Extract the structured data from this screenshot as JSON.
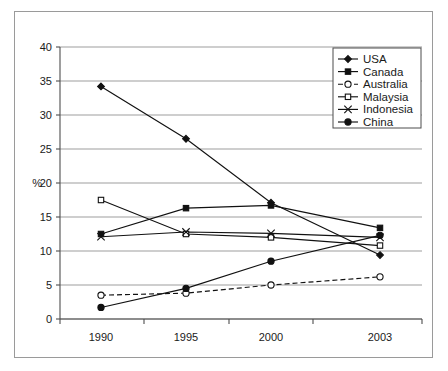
{
  "figure": {
    "background_color": "#ffffff",
    "frame_color": "#9a9a9a",
    "ink_color": "#111111",
    "grid_color": "#9d9d9d"
  },
  "axis": {
    "y_title": "%",
    "y_ticks": [
      "0",
      "5",
      "10",
      "15",
      "20",
      "25",
      "30",
      "35",
      "40"
    ],
    "x_ticks": [
      "1990",
      "1995",
      "2000",
      "2003"
    ]
  },
  "legend": {
    "position": "top-right",
    "entries": [
      {
        "label": "USA",
        "marker": "filled-diamond",
        "line": "solid"
      },
      {
        "label": "Canada",
        "marker": "filled-square",
        "line": "solid"
      },
      {
        "label": "Australia",
        "marker": "open-circle",
        "line": "dashed"
      },
      {
        "label": "Malaysia",
        "marker": "open-square",
        "line": "solid"
      },
      {
        "label": "Indonesia",
        "marker": "cross-x",
        "line": "solid"
      },
      {
        "label": "China",
        "marker": "filled-circle",
        "line": "solid"
      }
    ]
  },
  "chart_data": {
    "type": "line",
    "title": "",
    "subtitle": "",
    "xlabel": "",
    "ylabel": "%",
    "categories": [
      "1990",
      "1995",
      "2000",
      "2003"
    ],
    "ylim": [
      0,
      40
    ],
    "ytick_step": 5,
    "grid": true,
    "legend_position": "top-right",
    "series": [
      {
        "name": "USA",
        "values": [
          34.2,
          26.5,
          17.1,
          9.4
        ],
        "marker": "filled-diamond",
        "line": "solid"
      },
      {
        "name": "Canada",
        "values": [
          12.5,
          16.3,
          16.7,
          13.4
        ],
        "marker": "filled-square",
        "line": "solid"
      },
      {
        "name": "Australia",
        "values": [
          3.5,
          3.8,
          5.0,
          6.2
        ],
        "marker": "open-circle",
        "line": "dashed"
      },
      {
        "name": "Malaysia",
        "values": [
          17.5,
          12.5,
          12.0,
          10.8
        ],
        "marker": "open-square",
        "line": "solid"
      },
      {
        "name": "Indonesia",
        "values": [
          12.1,
          12.8,
          12.6,
          12.0
        ],
        "marker": "cross-x",
        "line": "solid"
      },
      {
        "name": "China",
        "values": [
          1.7,
          4.5,
          8.5,
          12.3
        ],
        "marker": "filled-circle",
        "line": "solid"
      }
    ]
  }
}
